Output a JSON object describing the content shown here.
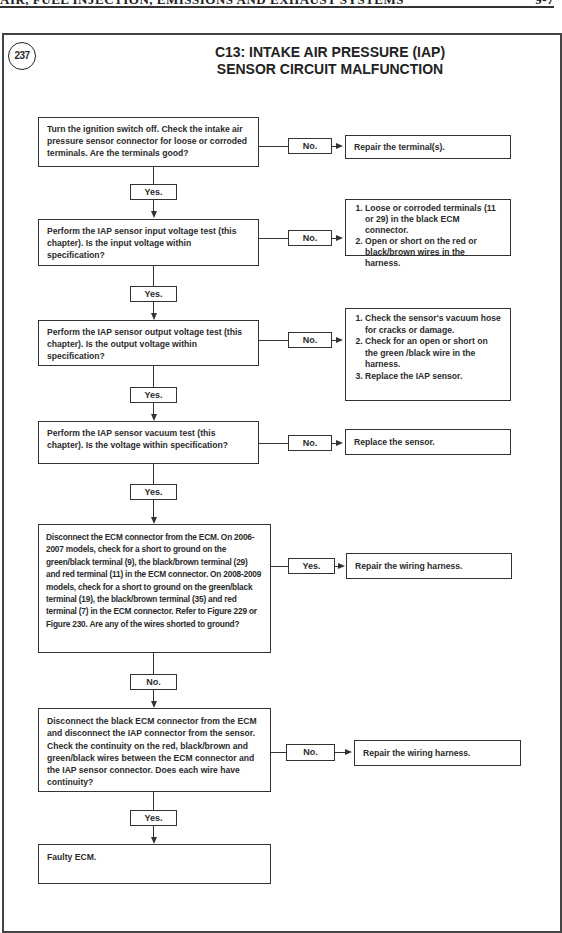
{
  "page_header": {
    "left_text": "AIR, FUEL INJECTION, EMISSIONS AND EXHAUST SYSTEMS",
    "right_text": "9-7"
  },
  "figure": {
    "number": "237",
    "title_line1": "C13: INTAKE AIR PRESSURE (IAP)",
    "title_line2": "SENSOR CIRCUIT MALFUNCTION"
  },
  "flowchart": {
    "steps": [
      {
        "text": "Turn the ignition switch off. Check the intake air pressure sensor connector for loose or corroded terminals. Are the terminals good?",
        "branch_label": "No.",
        "branch_result": "Repair the terminal(s).",
        "continue_label": "Yes."
      },
      {
        "text": "Perform the IAP sensor input voltage test (this chapter). Is the input voltage within specification?",
        "branch_label": "No.",
        "branch_result_items": [
          "Loose or corroded terminals (11 or 29) in the black ECM connector.",
          "Open or short on the red or black/brown wires in the harness."
        ],
        "continue_label": "Yes."
      },
      {
        "text": "Perform the IAP sensor output voltage test (this chapter). Is the output voltage within specification?",
        "branch_label": "No.",
        "branch_result_items": [
          "Check the sensor's vacuum hose for cracks or damage.",
          "Check for an open or short on the green /black wire in the harness.",
          "Replace the IAP sensor."
        ],
        "continue_label": "Yes."
      },
      {
        "text": "Perform the IAP sensor vacuum test (this chapter). Is the voltage within specification?",
        "branch_label": "No.",
        "branch_result": "Replace the sensor.",
        "continue_label": "Yes."
      },
      {
        "text": "Disconnect the ECM connector from the ECM. On 2006-2007 models, check for a short to ground on the green/black terminal (9), the black/brown terminal (29) and red terminal (11) in the ECM connector. On 2008-2009 models, check for a short to ground on the green/black terminal (19), the black/brown terminal (35) and red terminal (7) in the ECM connector. Refer to Figure 229 or Figure 230.  Are any of the wires shorted to ground?",
        "branch_label": "Yes.",
        "branch_result": "Repair the wiring harness.",
        "continue_label": "No."
      },
      {
        "text": "Disconnect the black ECM connector from the ECM and disconnect the IAP connector from the sensor. Check the continuity on the red, black/brown and green/black wires between the ECM connector and the IAP sensor connector. Does each wire have continuity?",
        "branch_label": "No.",
        "branch_result": "Repair the wiring harness.",
        "continue_label": "Yes."
      },
      {
        "text": "Faulty ECM."
      }
    ]
  }
}
